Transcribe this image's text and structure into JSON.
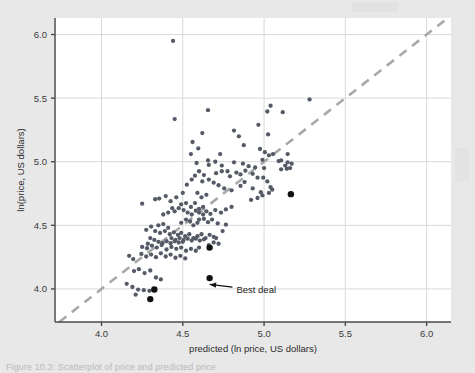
{
  "figure": {
    "caption": "Figure 10.3: Scatterplot of price and predicted price",
    "background_color": "#e8e8e8",
    "plot_background_color": "#ffffff",
    "point_color": "#555b66",
    "highlight_point_color": "#111111",
    "reference_line_color": "#a8a8a8",
    "gridline_color": "#d9d9d9",
    "axis_color": "#4a4a4a"
  },
  "chart_data": {
    "type": "scatter",
    "title": "",
    "xlabel": "predicted (ln price, US dollars)",
    "ylabel": "ln(price, US dollars)",
    "xlim": [
      3.72,
      6.15
    ],
    "ylim": [
      3.74,
      6.13
    ],
    "xticks": [
      4.0,
      4.5,
      5.0,
      5.5,
      6.0
    ],
    "xtick_labels": [
      "4.0",
      "4.5",
      "5.0",
      "5.5",
      "6.0"
    ],
    "yticks": [
      4.0,
      4.5,
      5.0,
      5.5,
      6.0
    ],
    "ytick_labels": [
      "4.0",
      "4.5",
      "5.0",
      "5.5",
      "6.0"
    ],
    "grid": true,
    "legend": "none",
    "reference_line": {
      "type": "identity",
      "label": "45-degree line (y = x)",
      "style": "dashed",
      "x_start": 3.74,
      "y_start": 3.74,
      "x_end": 6.13,
      "y_end": 6.13
    },
    "annotations": [
      {
        "text": "Best deal",
        "text_x": 4.83,
        "text_y": 3.99,
        "arrow_tip_x": 4.665,
        "arrow_tip_y": 4.075
      }
    ],
    "series": [
      {
        "name": "observations",
        "marker": "circle",
        "color": "#555b66",
        "points": [
          [
            4.44,
            5.95
          ],
          [
            4.45,
            5.335
          ],
          [
            4.655,
            5.405
          ],
          [
            5.04,
            5.44
          ],
          [
            5.02,
            5.395
          ],
          [
            5.115,
            5.39
          ],
          [
            5.28,
            5.49
          ],
          [
            4.56,
            5.155
          ],
          [
            4.62,
            5.225
          ],
          [
            4.965,
            5.29
          ],
          [
            5.025,
            5.215
          ],
          [
            4.815,
            5.245
          ],
          [
            4.595,
            5.105
          ],
          [
            4.55,
            5.06
          ],
          [
            4.585,
            4.99
          ],
          [
            4.655,
            5.01
          ],
          [
            4.73,
            5.06
          ],
          [
            4.975,
            5.1
          ],
          [
            5.005,
            5.075
          ],
          [
            5.03,
            5.05
          ],
          [
            5.055,
            5.06
          ],
          [
            5.09,
            5.005
          ],
          [
            5.105,
            5.01
          ],
          [
            5.13,
            4.97
          ],
          [
            5.14,
            4.945
          ],
          [
            5.145,
            4.995
          ],
          [
            5.105,
            4.94
          ],
          [
            4.99,
            5.015
          ],
          [
            5.0,
            4.95
          ],
          [
            4.945,
            4.955
          ],
          [
            4.905,
            4.965
          ],
          [
            4.87,
            4.985
          ],
          [
            4.815,
            4.995
          ],
          [
            4.775,
            4.925
          ],
          [
            4.74,
            4.925
          ],
          [
            4.705,
            4.91
          ],
          [
            4.79,
            4.885
          ],
          [
            4.83,
            4.915
          ],
          [
            4.855,
            4.9
          ],
          [
            4.885,
            4.93
          ],
          [
            4.93,
            4.905
          ],
          [
            4.96,
            4.875
          ],
          [
            4.63,
            4.895
          ],
          [
            4.6,
            4.925
          ],
          [
            4.575,
            4.89
          ],
          [
            4.555,
            4.86
          ],
          [
            4.525,
            4.82
          ],
          [
            4.62,
            4.845
          ],
          [
            4.66,
            4.86
          ],
          [
            4.69,
            4.835
          ],
          [
            4.72,
            4.815
          ],
          [
            4.755,
            4.79
          ],
          [
            4.8,
            4.775
          ],
          [
            4.93,
            4.79
          ],
          [
            4.98,
            4.76
          ],
          [
            5.03,
            4.755
          ],
          [
            5.04,
            4.8
          ],
          [
            5.05,
            4.78
          ],
          [
            4.99,
            4.735
          ],
          [
            4.96,
            4.715
          ],
          [
            4.92,
            4.7
          ],
          [
            4.5,
            4.755
          ],
          [
            4.46,
            4.72
          ],
          [
            4.425,
            4.69
          ],
          [
            4.395,
            4.73
          ],
          [
            4.355,
            4.71
          ],
          [
            4.25,
            4.67
          ],
          [
            4.33,
            4.705
          ],
          [
            4.49,
            4.665
          ],
          [
            4.52,
            4.675
          ],
          [
            4.55,
            4.645
          ],
          [
            4.575,
            4.675
          ],
          [
            4.6,
            4.63
          ],
          [
            4.625,
            4.645
          ],
          [
            4.645,
            4.61
          ],
          [
            4.625,
            4.585
          ],
          [
            4.6,
            4.6
          ],
          [
            4.58,
            4.615
          ],
          [
            4.555,
            4.585
          ],
          [
            4.53,
            4.6
          ],
          [
            4.505,
            4.62
          ],
          [
            4.475,
            4.635
          ],
          [
            4.45,
            4.61
          ],
          [
            4.435,
            4.635
          ],
          [
            4.41,
            4.6
          ],
          [
            4.38,
            4.585
          ],
          [
            4.67,
            4.59
          ],
          [
            4.7,
            4.62
          ],
          [
            4.735,
            4.6
          ],
          [
            4.765,
            4.625
          ],
          [
            4.8,
            4.645
          ],
          [
            4.6,
            4.545
          ],
          [
            4.63,
            4.55
          ],
          [
            4.655,
            4.525
          ],
          [
            4.68,
            4.545
          ],
          [
            4.715,
            4.515
          ],
          [
            4.49,
            4.52
          ],
          [
            4.52,
            4.545
          ],
          [
            4.545,
            4.53
          ],
          [
            4.565,
            4.5
          ],
          [
            4.59,
            4.52
          ],
          [
            4.35,
            4.5
          ],
          [
            4.38,
            4.51
          ],
          [
            4.41,
            4.48
          ],
          [
            4.305,
            4.49
          ],
          [
            4.275,
            4.465
          ],
          [
            4.33,
            4.455
          ],
          [
            4.36,
            4.44
          ],
          [
            4.39,
            4.455
          ],
          [
            4.42,
            4.43
          ],
          [
            4.445,
            4.445
          ],
          [
            4.47,
            4.425
          ],
          [
            4.49,
            4.44
          ],
          [
            4.515,
            4.415
          ],
          [
            4.54,
            4.43
          ],
          [
            4.565,
            4.4
          ],
          [
            4.59,
            4.415
          ],
          [
            4.615,
            4.43
          ],
          [
            4.64,
            4.4
          ],
          [
            4.665,
            4.425
          ],
          [
            4.69,
            4.41
          ],
          [
            4.43,
            4.4
          ],
          [
            4.455,
            4.385
          ],
          [
            4.48,
            4.4
          ],
          [
            4.505,
            4.385
          ],
          [
            4.53,
            4.395
          ],
          [
            4.555,
            4.38
          ],
          [
            4.58,
            4.395
          ],
          [
            4.605,
            4.38
          ],
          [
            4.63,
            4.39
          ],
          [
            4.5,
            4.37
          ],
          [
            4.475,
            4.365
          ],
          [
            4.45,
            4.375
          ],
          [
            4.425,
            4.36
          ],
          [
            4.4,
            4.375
          ],
          [
            4.375,
            4.36
          ],
          [
            4.35,
            4.37
          ],
          [
            4.325,
            4.385
          ],
          [
            4.3,
            4.4
          ],
          [
            4.285,
            4.355
          ],
          [
            4.66,
            4.345
          ],
          [
            4.69,
            4.365
          ],
          [
            4.705,
            4.4
          ],
          [
            4.72,
            4.355
          ],
          [
            4.765,
            4.505
          ],
          [
            4.745,
            4.455
          ],
          [
            4.25,
            4.33
          ],
          [
            4.28,
            4.32
          ],
          [
            4.31,
            4.34
          ],
          [
            4.34,
            4.325
          ],
          [
            4.37,
            4.345
          ],
          [
            4.4,
            4.31
          ],
          [
            4.43,
            4.33
          ],
          [
            4.46,
            4.315
          ],
          [
            4.49,
            4.325
          ],
          [
            4.52,
            4.3
          ],
          [
            4.55,
            4.315
          ],
          [
            4.58,
            4.3
          ],
          [
            4.6,
            4.325
          ],
          [
            4.245,
            4.275
          ],
          [
            4.275,
            4.255
          ],
          [
            4.305,
            4.27
          ],
          [
            4.335,
            4.25
          ],
          [
            4.365,
            4.28
          ],
          [
            4.395,
            4.255
          ],
          [
            4.425,
            4.27
          ],
          [
            4.455,
            4.245
          ],
          [
            4.485,
            4.26
          ],
          [
            4.515,
            4.24
          ],
          [
            4.17,
            4.26
          ],
          [
            4.195,
            4.235
          ],
          [
            4.2,
            4.14
          ],
          [
            4.23,
            4.155
          ],
          [
            4.265,
            4.125
          ],
          [
            4.3,
            4.145
          ],
          [
            4.335,
            4.09
          ],
          [
            4.365,
            4.075
          ],
          [
            4.155,
            4.04
          ],
          [
            4.19,
            4.015
          ],
          [
            4.225,
            3.995
          ],
          [
            4.26,
            3.99
          ],
          [
            4.295,
            3.985
          ],
          [
            4.21,
            3.955
          ],
          [
            4.875,
            5.13
          ],
          [
            4.845,
            5.2
          ],
          [
            5.16,
            4.95
          ],
          [
            5.17,
            4.985
          ],
          [
            5.145,
            5.06
          ],
          [
            4.995,
            4.875
          ],
          [
            5.02,
            4.845
          ],
          [
            4.88,
            4.84
          ],
          [
            4.855,
            4.81
          ],
          [
            4.7,
            5.0
          ],
          [
            4.66,
            4.975
          ],
          [
            4.74,
            4.97
          ],
          [
            4.645,
            4.74
          ],
          [
            4.615,
            4.72
          ],
          [
            4.59,
            4.755
          ]
        ]
      },
      {
        "name": "highlighted observations",
        "marker": "circle-large",
        "color": "#111111",
        "points": [
          [
            5.165,
            4.745
          ],
          [
            4.665,
            4.325
          ],
          [
            4.665,
            4.085
          ],
          [
            4.325,
            3.995
          ],
          [
            4.3,
            3.92
          ]
        ]
      }
    ]
  },
  "axes": {
    "x_axis_label": "predicted (ln price, US dollars)",
    "y_axis_label": "ln(price, US dollars)"
  }
}
